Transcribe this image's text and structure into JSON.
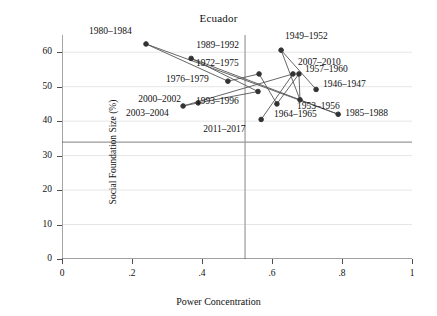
{
  "chart_data": {
    "type": "scatter",
    "title": "Ecuador",
    "xlabel": "Power Concentration",
    "ylabel": "Social Foundation Size (%)",
    "xlim": [
      0,
      1
    ],
    "ylim": [
      0,
      65
    ],
    "xticks": [
      "0",
      ".2",
      ".4",
      ".6",
      ".8",
      "1"
    ],
    "xtick_values": [
      0,
      0.2,
      0.4,
      0.6,
      0.8,
      1
    ],
    "yticks": [
      "0",
      "10",
      "20",
      "30",
      "40",
      "50",
      "60"
    ],
    "ytick_values": [
      0,
      10,
      20,
      30,
      40,
      50,
      60
    ],
    "grid": true,
    "legend": "none",
    "reference_lines": {
      "vertical_x": 0.523,
      "horizontal_y": 33.9
    },
    "connected": true,
    "points": [
      {
        "label": "1946–1947",
        "x": 0.726,
        "y": 49.2,
        "label_dx": 7,
        "label_dy": -4
      },
      {
        "label": "1949–1952",
        "x": 0.626,
        "y": 60.6,
        "label_dx": 4,
        "label_dy": -13
      },
      {
        "label": "1953–1956",
        "x": 0.68,
        "y": 46.2,
        "label_dx": -3,
        "label_dy": 7
      },
      {
        "label": "1957–1960",
        "x": 0.677,
        "y": 53.7,
        "label_dx": 6,
        "label_dy": -4
      },
      {
        "label": "1964–1965",
        "x": 0.614,
        "y": 45.0,
        "label_dx": -3,
        "label_dy": 11
      },
      {
        "label": "1972–1975",
        "x": 0.563,
        "y": 53.7,
        "label_dx": -63,
        "label_dy": -10
      },
      {
        "label": "1976–1979",
        "x": 0.474,
        "y": 51.6,
        "label_dx": -62,
        "label_dy": -1
      },
      {
        "label": "1980–1984",
        "x": 0.24,
        "y": 62.4,
        "label_dx": -57,
        "label_dy": -12
      },
      {
        "label": "1985–1988",
        "x": 0.789,
        "y": 42.0,
        "label_dx": 7,
        "label_dy": 0
      },
      {
        "label": "1989–1992",
        "x": 0.369,
        "y": 58.2,
        "label_dx": 5,
        "label_dy": -12
      },
      {
        "label": "1993–1996",
        "x": 0.56,
        "y": 48.6,
        "label_dx": -62,
        "label_dy": 10
      },
      {
        "label": "2000–2002",
        "x": 0.389,
        "y": 45.3,
        "label_dx": -60,
        "label_dy": -3
      },
      {
        "label": "2003–2004",
        "x": 0.346,
        "y": 44.4,
        "label_dx": -57,
        "label_dy": 8
      },
      {
        "label": "2007–2010",
        "x": 0.66,
        "y": 53.7,
        "label_dx": 5,
        "label_dy": -11
      },
      {
        "label": "2011–2017",
        "x": 0.569,
        "y": 40.5,
        "label_dx": -58,
        "label_dy": 11
      }
    ],
    "path_order": [
      "1946–1947",
      "1949–1952",
      "1953–1956",
      "1957–1960",
      "1964–1965",
      "1972–1975",
      "1976–1979",
      "1980–1984",
      "1985–1988",
      "1989–1992",
      "1993–1996",
      "2000–2002",
      "2003–2004",
      "2007–2010",
      "2011–2017"
    ],
    "colors": {
      "marker": "#333333",
      "line": "#555555",
      "grid": "#e6e6e6",
      "axis": "#4d4d4d",
      "reference_line": "#999999",
      "text": "#111111"
    }
  }
}
